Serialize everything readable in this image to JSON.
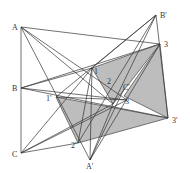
{
  "figure": {
    "colors": {
      "line": "#333333",
      "fill": "#bdbdbd",
      "background": "#ffffff"
    },
    "points": {
      "A": {
        "label": "A",
        "x": 21,
        "y": 27
      },
      "B": {
        "label": "B",
        "x": 21,
        "y": 88
      },
      "C": {
        "label": "C",
        "x": 21,
        "y": 153
      },
      "Ap": {
        "label": "A'",
        "x": 90,
        "y": 160
      },
      "Bp": {
        "label": "B'",
        "x": 156,
        "y": 15
      },
      "Cp": {
        "label": "C'",
        "x": 124,
        "y": 89
      },
      "P1": {
        "label": "1",
        "x": 92,
        "y": 68
      },
      "P2": {
        "label": "2",
        "x": 113,
        "y": 104
      },
      "P3": {
        "label": "3",
        "x": 160,
        "y": 44
      },
      "P1p": {
        "label": "1'",
        "x": 56,
        "y": 97
      },
      "P2p": {
        "label": "2'",
        "x": 78,
        "y": 143
      },
      "P3p": {
        "label": "3'",
        "x": 168,
        "y": 118
      },
      "P3b": {
        "label": "3",
        "x": 127,
        "y": 100
      }
    }
  }
}
